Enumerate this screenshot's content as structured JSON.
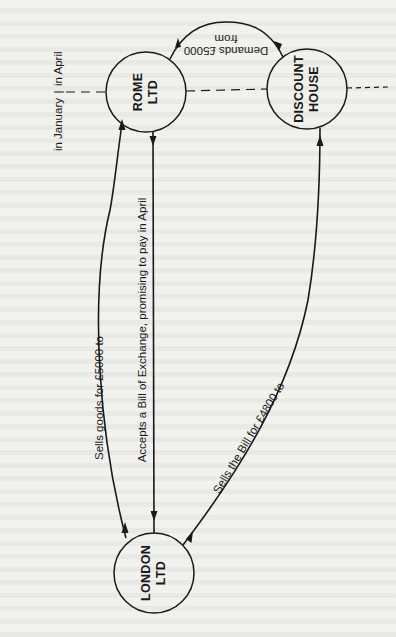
{
  "diagram": {
    "type": "bill-of-exchange-flow",
    "orientation": "rotated-90-ccw",
    "nodes": [
      {
        "id": "rome",
        "line1": "ROME",
        "line2": "LTD"
      },
      {
        "id": "discount",
        "line1": "DISCOUNT",
        "line2": "HOUSE"
      },
      {
        "id": "london",
        "line1": "LONDON",
        "line2": "LTD"
      }
    ],
    "edges": [
      {
        "id": "sells-goods",
        "from": "london",
        "to": "rome",
        "label": "Sells goods for £5000 to"
      },
      {
        "id": "accepts-bill",
        "from": "rome",
        "to": "london",
        "label": "Accepts a Bill of Exchange, promising to pay in April"
      },
      {
        "id": "sells-bill",
        "from": "london",
        "to": "discount",
        "label": "Sells the Bill for £4800 to"
      },
      {
        "id": "demands",
        "from": "discount",
        "to": "rome",
        "label_line1": "Demands £5000",
        "label_line2": "from"
      }
    ],
    "timeline": {
      "before": "in January",
      "separator": "|",
      "after": "in April"
    },
    "colors": {
      "ink": "#1a1a1a",
      "paper": "#f1f1ee"
    }
  }
}
